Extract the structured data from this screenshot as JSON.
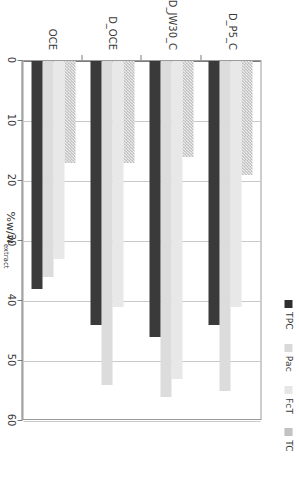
{
  "chart_data": {
    "type": "bar",
    "orientation": "horizontal",
    "title": "",
    "xlabel": "%w/w extract",
    "ylabel": "",
    "xlim": [
      0,
      60
    ],
    "ticks": [
      0,
      10,
      20,
      30,
      40,
      50,
      60
    ],
    "grid": true,
    "legend_position": "top",
    "categories": [
      "OCE",
      "D_OCE",
      "D_JW30_C",
      "D_P5_C"
    ],
    "series": [
      {
        "name": "TPC",
        "color": "#3a3a3a",
        "values": [
          38,
          44,
          46,
          44
        ]
      },
      {
        "name": "Pac",
        "color": "#dcdcdc",
        "values": [
          36,
          54,
          56,
          55
        ]
      },
      {
        "name": "FcT",
        "color": "#e8e8e8",
        "values": [
          33,
          41,
          53,
          41
        ]
      },
      {
        "name": "TC",
        "color": "#ececec",
        "values": [
          17,
          17,
          16,
          19
        ]
      }
    ]
  },
  "legend": {
    "items": [
      {
        "label": "TPC",
        "swatch": "solid-dark-square-icon"
      },
      {
        "label": "Pac",
        "swatch": "solid-lightgray-square-icon"
      },
      {
        "label": "FcT",
        "swatch": "solid-lighter-square-icon"
      },
      {
        "label": "TC",
        "swatch": "checkered-square-icon"
      }
    ]
  },
  "axis": {
    "value_labels": [
      "60",
      "50",
      "40",
      "30",
      "20",
      "10",
      "0"
    ],
    "value_title_main": "%w/w",
    "value_title_sub": "extract",
    "category_labels": [
      "D_P5_C",
      "D_JW30_C",
      "D_OCE",
      "OCE"
    ]
  }
}
